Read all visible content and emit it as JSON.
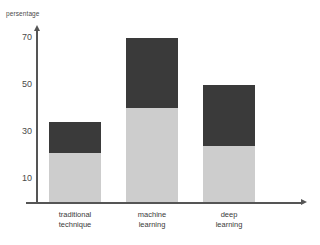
{
  "chart_data": {
    "type": "bar",
    "title": "",
    "subtitle": "",
    "xlabel": "",
    "ylabel": "persentage",
    "categories": [
      "traditional\ntechnique",
      "machine\nlearning",
      "deep\nlearning"
    ],
    "category_lines": [
      [
        "traditional",
        "technique"
      ],
      [
        "machine",
        "learning"
      ],
      [
        "deep",
        "learning"
      ]
    ],
    "stacked": true,
    "series": [
      {
        "name": "lower-segment",
        "color": "#cdcdcd",
        "values": [
          21,
          40,
          24
        ]
      },
      {
        "name": "upper-segment",
        "color": "#3a3a3a",
        "values": [
          13,
          30,
          26
        ]
      }
    ],
    "totals": [
      34,
      70,
      50
    ],
    "yticks": [
      10,
      30,
      50,
      70
    ],
    "ytick_labels": [
      "10",
      "30",
      "50",
      "70"
    ],
    "ylim": [
      0,
      78
    ],
    "grid": false,
    "legend": "none"
  },
  "axes": {
    "y_axis_name": "y-axis",
    "x_axis_name": "x-axis"
  },
  "colors": {
    "bar_dark": "#3a3a3a",
    "bar_light": "#cdcdcd",
    "axis": "#555555",
    "text": "#3a3a3a",
    "background": "#ffffff"
  }
}
